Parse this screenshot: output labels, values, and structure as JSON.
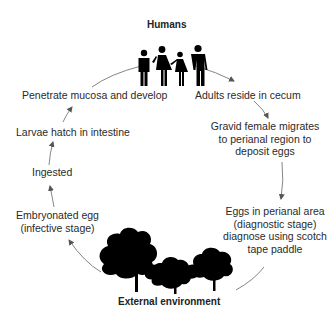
{
  "diagram": {
    "top_node": {
      "label": "Humans",
      "icon": "people-family-icon"
    },
    "bottom_node": {
      "label": "External environment",
      "icon": "trees-icon"
    },
    "steps": [
      {
        "id": "penetrate",
        "lines": [
          "Penetrate mucosa and develop"
        ]
      },
      {
        "id": "adults",
        "lines": [
          "Adults reside in cecum"
        ]
      },
      {
        "id": "gravid",
        "lines": [
          "Gravid female migrates",
          "to perianal region to",
          "deposit eggs"
        ]
      },
      {
        "id": "eggs-perianal",
        "lines": [
          "Eggs in perianal area",
          "(diagnostic stage)",
          "diagnose using scotch",
          "tape paddle"
        ]
      },
      {
        "id": "embryonated",
        "lines": [
          "Embryonated egg",
          "(infective stage)"
        ]
      },
      {
        "id": "ingested",
        "lines": [
          "Ingested"
        ]
      },
      {
        "id": "larvae",
        "lines": [
          "Larvae hatch in intestine"
        ]
      }
    ],
    "flow": [
      "Humans",
      "Adults reside in cecum",
      "Gravid female migrates to perianal region to deposit eggs",
      "Eggs in perianal area (diagnostic stage) diagnose using scotch tape paddle",
      "External environment",
      "Embryonated egg (infective stage)",
      "Ingested",
      "Larvae hatch in intestine",
      "Penetrate mucosa and develop",
      "Humans"
    ],
    "colors": {
      "text": "#2a2a2a",
      "arrow": "#555555",
      "silhouette": "#000000",
      "background": "#ffffff"
    }
  }
}
